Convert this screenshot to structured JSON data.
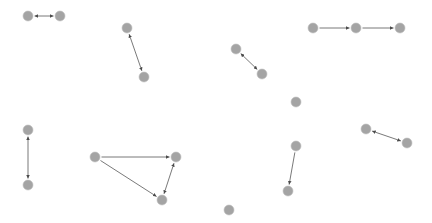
{
  "diagram": {
    "type": "directed-graph",
    "background": "#ffffff",
    "node_color": "#a4a4a4",
    "edge_color": "#6a6a6a",
    "node_radius": 5,
    "nodes": [
      {
        "id": "n1",
        "x": 28,
        "y": 16
      },
      {
        "id": "n2",
        "x": 60,
        "y": 16
      },
      {
        "id": "n3",
        "x": 127,
        "y": 28
      },
      {
        "id": "n4",
        "x": 144,
        "y": 77
      },
      {
        "id": "n5",
        "x": 236,
        "y": 49
      },
      {
        "id": "n6",
        "x": 262,
        "y": 74
      },
      {
        "id": "n7",
        "x": 313,
        "y": 28
      },
      {
        "id": "n8",
        "x": 356,
        "y": 28
      },
      {
        "id": "n9",
        "x": 400,
        "y": 28
      },
      {
        "id": "n10",
        "x": 296,
        "y": 102
      },
      {
        "id": "n11",
        "x": 366,
        "y": 129
      },
      {
        "id": "n12",
        "x": 407,
        "y": 143
      },
      {
        "id": "n13",
        "x": 28,
        "y": 130
      },
      {
        "id": "n14",
        "x": 28,
        "y": 185
      },
      {
        "id": "n15",
        "x": 95,
        "y": 157
      },
      {
        "id": "n16",
        "x": 176,
        "y": 157
      },
      {
        "id": "n17",
        "x": 162,
        "y": 200
      },
      {
        "id": "n18",
        "x": 296,
        "y": 146
      },
      {
        "id": "n19",
        "x": 288,
        "y": 191
      },
      {
        "id": "n20",
        "x": 229,
        "y": 210
      }
    ],
    "edges": [
      {
        "from": "n1",
        "to": "n2",
        "direction": "both"
      },
      {
        "from": "n3",
        "to": "n4",
        "direction": "both"
      },
      {
        "from": "n5",
        "to": "n6",
        "direction": "both"
      },
      {
        "from": "n7",
        "to": "n8",
        "direction": "forward"
      },
      {
        "from": "n8",
        "to": "n9",
        "direction": "forward"
      },
      {
        "from": "n11",
        "to": "n12",
        "direction": "both"
      },
      {
        "from": "n13",
        "to": "n14",
        "direction": "both"
      },
      {
        "from": "n15",
        "to": "n16",
        "direction": "forward"
      },
      {
        "from": "n15",
        "to": "n17",
        "direction": "forward"
      },
      {
        "from": "n17",
        "to": "n16",
        "direction": "both"
      },
      {
        "from": "n18",
        "to": "n19",
        "direction": "forward"
      }
    ]
  }
}
